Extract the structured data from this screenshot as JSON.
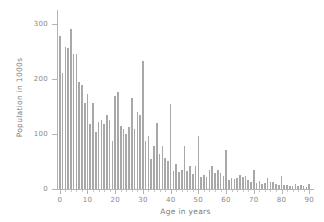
{
  "chart_data": {
    "type": "bar",
    "title": "",
    "xlabel": "Age in years",
    "ylabel": "Population in 1000s",
    "xlim": [
      -1,
      91
    ],
    "ylim": [
      0,
      320
    ],
    "xticks": [
      0,
      10,
      20,
      30,
      40,
      50,
      60,
      70,
      80,
      90
    ],
    "xtick_labels": [
      "0",
      "10",
      "20",
      "30",
      "40",
      "50",
      "60",
      "70",
      "80",
      "90"
    ],
    "yticks": [
      0,
      100,
      200,
      300
    ],
    "ytick_labels": [
      "0",
      "100",
      "200",
      "300"
    ],
    "grid": false,
    "legend": null,
    "bar_color": "#a8a8a8",
    "categories": [
      0,
      1,
      2,
      3,
      4,
      5,
      6,
      7,
      8,
      9,
      10,
      11,
      12,
      13,
      14,
      15,
      16,
      17,
      18,
      19,
      20,
      21,
      22,
      23,
      24,
      25,
      26,
      27,
      28,
      29,
      30,
      31,
      32,
      33,
      34,
      35,
      36,
      37,
      38,
      39,
      40,
      41,
      42,
      43,
      44,
      45,
      46,
      47,
      48,
      49,
      50,
      51,
      52,
      53,
      54,
      55,
      56,
      57,
      58,
      59,
      60,
      61,
      62,
      63,
      64,
      65,
      66,
      67,
      68,
      69,
      70,
      71,
      72,
      73,
      74,
      75,
      76,
      77,
      78,
      79,
      80,
      81,
      82,
      83,
      84,
      85,
      86,
      87,
      88,
      89,
      90
    ],
    "values": [
      279,
      211,
      259,
      257,
      291,
      246,
      245,
      195,
      190,
      157,
      172,
      119,
      156,
      103,
      122,
      125,
      119,
      134,
      125,
      88,
      170,
      176,
      114,
      110,
      100,
      113,
      166,
      110,
      140,
      134,
      233,
      87,
      96,
      54,
      79,
      120,
      64,
      78,
      56,
      51,
      155,
      32,
      46,
      31,
      34,
      78,
      32,
      41,
      28,
      41,
      96,
      22,
      26,
      22,
      35,
      41,
      29,
      35,
      30,
      23,
      71,
      16,
      20,
      19,
      20,
      25,
      22,
      23,
      16,
      13,
      35,
      11,
      14,
      10,
      11,
      20,
      12,
      13,
      9,
      8,
      24,
      7,
      8,
      6,
      5,
      10,
      6,
      7,
      5,
      4,
      10
    ]
  },
  "axes": {
    "y_title": "Population in 1000s",
    "x_title": "Age in years"
  }
}
